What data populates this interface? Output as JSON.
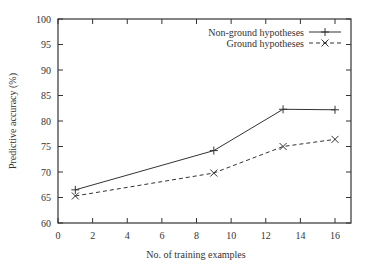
{
  "chart_data": {
    "type": "line",
    "title": "",
    "xlabel": "No. of training examples",
    "ylabel": "Predictive accuracy (%)",
    "xlim": [
      0,
      17
    ],
    "ylim": [
      60,
      100
    ],
    "xticks": [
      0,
      2,
      4,
      6,
      8,
      10,
      12,
      14,
      16
    ],
    "yticks": [
      60,
      65,
      70,
      75,
      80,
      85,
      90,
      95,
      100
    ],
    "grid": false,
    "legend_position": "top-right",
    "x": [
      1,
      9,
      13,
      16
    ],
    "series": [
      {
        "name": "Non-ground hypotheses",
        "style": "solid",
        "marker": "+",
        "values": [
          66.5,
          74.2,
          82.3,
          82.2
        ]
      },
      {
        "name": "Ground hypotheses",
        "style": "dashed",
        "marker": "x",
        "values": [
          65.3,
          69.8,
          75.0,
          76.4
        ]
      }
    ]
  }
}
